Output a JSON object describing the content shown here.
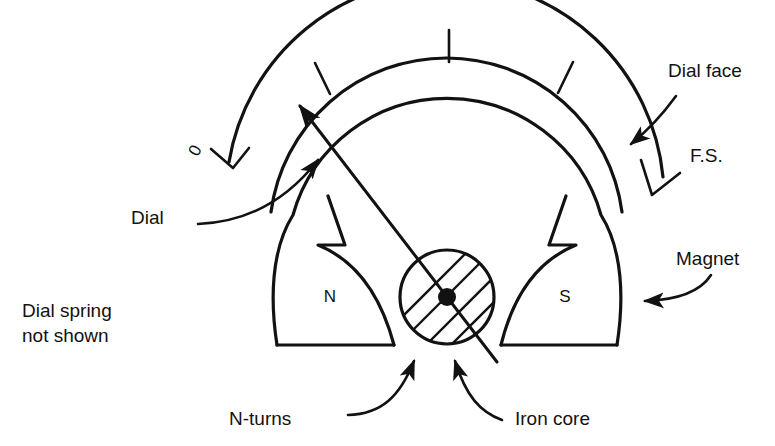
{
  "figure": {
    "background_color": "#ffffff",
    "ink_color": "#121212"
  },
  "labels": {
    "dial_face": "Dial face",
    "full_scale": "F.S.",
    "magnet": "Magnet",
    "iron_core": "Iron core",
    "n_turns": "N-turns",
    "dial": "Dial",
    "zero_mark": "0",
    "pole_north": "N",
    "pole_south": "S",
    "note_line1": "Dial spring",
    "note_line2": "not shown"
  },
  "components": {
    "dial_face_arc": "outer graduated scale arc",
    "dial_arc_inner": "inner dial arc",
    "magnet_body": "horseshoe permanent magnet with notched pole pieces",
    "iron_core": "circular laminated iron core",
    "coil_hatching": "N-turns coil winding shown as parallel hatch band",
    "pivot": "needle pivot point",
    "needle": "indicating needle/pointer",
    "scale_ticks": "graduation tick marks on dial face"
  },
  "annotations": [
    {
      "name": "dial-face",
      "text": "Dial face",
      "points_to": "outer dial arc"
    },
    {
      "name": "full-scale",
      "text": "F.S.",
      "points_to": "full scale end tick"
    },
    {
      "name": "magnet",
      "text": "Magnet",
      "points_to": "magnet south arm"
    },
    {
      "name": "iron-core",
      "text": "Iron core",
      "points_to": "core circle"
    },
    {
      "name": "n-turns",
      "text": "N-turns",
      "points_to": "coil hatching"
    },
    {
      "name": "dial",
      "text": "Dial",
      "points_to": "dial arc left end"
    },
    {
      "name": "zero",
      "text": "0",
      "points_to": "zero tick mark"
    }
  ]
}
